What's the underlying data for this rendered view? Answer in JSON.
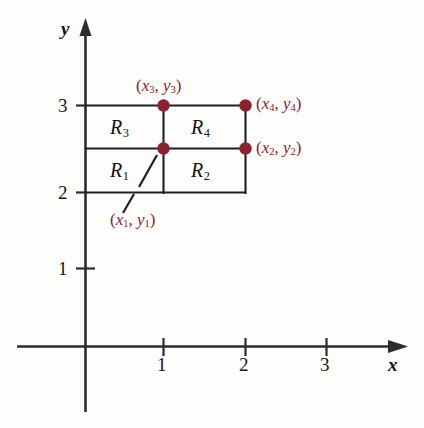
{
  "figure": {
    "background_color": "#fdfdfc",
    "line_color": "#1a1a1a",
    "point_color": "#8c2230",
    "label_color": "#8c2230"
  },
  "axes": {
    "x_label": "x",
    "y_label": "y",
    "x_ticks": [
      "1",
      "2",
      "3"
    ],
    "y_ticks": [
      "1",
      "2",
      "3"
    ],
    "x_range": [
      0,
      3.6
    ],
    "y_range": [
      0,
      3.6
    ],
    "grid": false
  },
  "regions": [
    {
      "name": "R",
      "subscript": "1",
      "x": 0.5,
      "y": 2.25
    },
    {
      "name": "R",
      "subscript": "2",
      "x": 1.5,
      "y": 2.25
    },
    {
      "name": "R",
      "subscript": "3",
      "x": 0.5,
      "y": 2.75
    },
    {
      "name": "R",
      "subscript": "4",
      "x": 1.5,
      "y": 2.75
    }
  ],
  "points": [
    {
      "label_open": "(",
      "x_var": "x",
      "sub": "1",
      "sep": ", ",
      "y_var": "y",
      "label_close": ")",
      "x": 1,
      "y": 2.5,
      "leader": true
    },
    {
      "label_open": "(",
      "x_var": "x",
      "sub": "2",
      "sep": ", ",
      "y_var": "y",
      "label_close": ")",
      "x": 2,
      "y": 2.5,
      "leader": false
    },
    {
      "label_open": "(",
      "x_var": "x",
      "sub": "3",
      "sep": ", ",
      "y_var": "y",
      "label_close": ")",
      "x": 1,
      "y": 3,
      "leader": false
    },
    {
      "label_open": "(",
      "x_var": "x",
      "sub": "4",
      "sep": ", ",
      "y_var": "y",
      "label_close": ")",
      "x": 2,
      "y": 3,
      "leader": false
    }
  ],
  "point_labels": {
    "p1_open": "(",
    "p1_x": "x",
    "p1_xs": "1",
    "p1_sep": ", ",
    "p1_y": "y",
    "p1_ys": "1",
    "p1_close": ")",
    "p2_open": "(",
    "p2_x": "x",
    "p2_xs": "2",
    "p2_sep": ", ",
    "p2_y": "y",
    "p2_ys": "2",
    "p2_close": ")",
    "p3_open": "(",
    "p3_x": "x",
    "p3_xs": "3",
    "p3_sep": ", ",
    "p3_y": "y",
    "p3_ys": "3",
    "p3_close": ")",
    "p4_open": "(",
    "p4_x": "x",
    "p4_xs": "4",
    "p4_sep": ", ",
    "p4_y": "y",
    "p4_ys": "4",
    "p4_close": ")"
  },
  "region_labels": {
    "r1": "R",
    "r1s": "1",
    "r2": "R",
    "r2s": "2",
    "r3": "R",
    "r3s": "3",
    "r4": "R",
    "r4s": "4"
  },
  "tick_labels": {
    "x1": "1",
    "x2": "2",
    "x3": "3",
    "y1": "1",
    "y2": "2",
    "y3": "3"
  },
  "axis_names": {
    "x": "x",
    "y": "y"
  }
}
